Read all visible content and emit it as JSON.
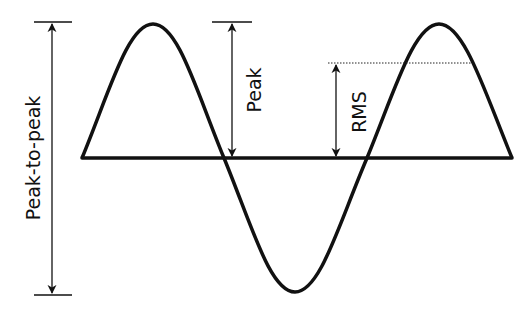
{
  "diagram": {
    "labels": {
      "peak_to_peak": "Peak-to-peak",
      "peak": "Peak",
      "rms": "RMS"
    },
    "colors": {
      "stroke": "#111111",
      "background": "#ffffff"
    }
  }
}
